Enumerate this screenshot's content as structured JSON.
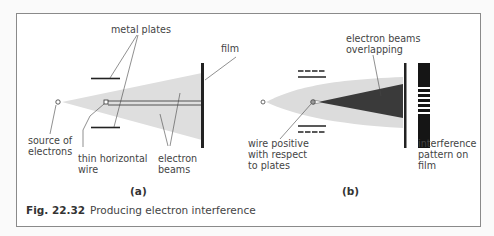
{
  "caption": {
    "number": "Fig. 22.32",
    "text": "Producing electron interference"
  },
  "panel_a": {
    "label": "(a)",
    "labels": {
      "metal_plates": "metal plates",
      "film": "film",
      "source_line1": "source of",
      "source_line2": "electrons",
      "wire_line1": "thin horizontal",
      "wire_line2": "wire",
      "beams_line1": "electron",
      "beams_line2": "beams"
    }
  },
  "panel_b": {
    "label": "(b)",
    "labels": {
      "overlap_line1": "electron beams",
      "overlap_line2": "overlapping",
      "wire_line1": "wire positive",
      "wire_line2": "with respect",
      "wire_line3": "to plates",
      "pattern_line1": "interference",
      "pattern_line2": "pattern on",
      "pattern_line3": "film"
    }
  },
  "colors": {
    "beam_light": "#dcdcdc",
    "beam_dark": "#3a3a3a",
    "ink": "#222222",
    "frame": "#8a8a8a"
  }
}
